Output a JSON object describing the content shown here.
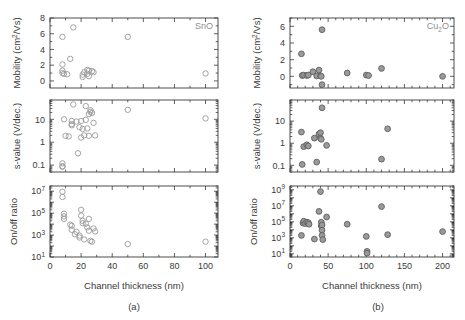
{
  "figure": {
    "title": "",
    "panels": [
      {
        "caption": "(a)",
        "material_label": "SnO",
        "xlabel": "Channel thickness (nm)"
      },
      {
        "caption": "(b)",
        "material_label": "Cu2O",
        "material_label_parts": {
          "pre": "Cu",
          "sub": "2",
          "post": "O"
        },
        "xlabel": "Channel thickness (nm)"
      }
    ]
  },
  "colors": {
    "axis": "#3a3a3a",
    "open_marker_stroke": "#9a9a9a",
    "filled_marker_fill": "#9a9a9a",
    "filled_marker_stroke": "#5f5f5f",
    "label_gray": "#9a9a9a",
    "background": "#ffffff"
  },
  "chart_data": [
    {
      "type": "scatter",
      "panel": "a",
      "subplot": "mobility",
      "title": "SnO",
      "xlabel": "Channel thickness (nm)",
      "ylabel": "Mobility (cm^2/Vs)",
      "ylabel_parts": {
        "pre": "Mobility (cm",
        "sup": "2",
        "post": "/Vs)"
      },
      "xlim": [
        0,
        108
      ],
      "ylim": [
        -0.9,
        8
      ],
      "yticks": [
        0,
        2,
        4,
        6,
        8
      ],
      "xticks": [
        0,
        20,
        40,
        60,
        80,
        100
      ],
      "xminor": 10,
      "marker": "open-circle",
      "grid": false,
      "points": [
        {
          "x": 8,
          "y": 5.6
        },
        {
          "x": 8,
          "y": 2.1
        },
        {
          "x": 8,
          "y": 1.3
        },
        {
          "x": 8,
          "y": 1.0
        },
        {
          "x": 9,
          "y": 0.9
        },
        {
          "x": 11,
          "y": 0.85
        },
        {
          "x": 13,
          "y": 2.8
        },
        {
          "x": 15,
          "y": 6.8
        },
        {
          "x": 21,
          "y": 0.8
        },
        {
          "x": 21,
          "y": 0.5
        },
        {
          "x": 22,
          "y": 1.1
        },
        {
          "x": 24,
          "y": 1.4
        },
        {
          "x": 24,
          "y": 0.9
        },
        {
          "x": 25,
          "y": 1.3
        },
        {
          "x": 25,
          "y": 0.6
        },
        {
          "x": 27,
          "y": 1.25
        },
        {
          "x": 28,
          "y": 1.1
        },
        {
          "x": 50,
          "y": 5.6
        },
        {
          "x": 100,
          "y": 0.95
        }
      ]
    },
    {
      "type": "scatter",
      "panel": "a",
      "subplot": "s-value",
      "xlabel": "Channel thickness (nm)",
      "ylabel": "s-value (V/dec.)",
      "xlim": [
        0,
        108
      ],
      "ylim": [
        0.05,
        70
      ],
      "yscale": "log",
      "yticks": [
        0.1,
        1,
        10
      ],
      "ytick_labels": [
        "0.1",
        "1",
        "10"
      ],
      "xticks": [
        0,
        20,
        40,
        60,
        80,
        100
      ],
      "marker": "open-circle",
      "grid": false,
      "points": [
        {
          "x": 8,
          "y": 0.12
        },
        {
          "x": 8,
          "y": 0.09
        },
        {
          "x": 8,
          "y": 0.085
        },
        {
          "x": 9,
          "y": 10
        },
        {
          "x": 10,
          "y": 1.9
        },
        {
          "x": 12,
          "y": 1.8
        },
        {
          "x": 14,
          "y": 8.5
        },
        {
          "x": 14,
          "y": 6.2
        },
        {
          "x": 14,
          "y": 5.5
        },
        {
          "x": 15,
          "y": 45
        },
        {
          "x": 17,
          "y": 8
        },
        {
          "x": 18,
          "y": 0.33
        },
        {
          "x": 19,
          "y": 4.5
        },
        {
          "x": 20,
          "y": 1.6
        },
        {
          "x": 20,
          "y": 8.5
        },
        {
          "x": 21,
          "y": 3.8
        },
        {
          "x": 22,
          "y": 2.0
        },
        {
          "x": 23,
          "y": 9.5
        },
        {
          "x": 23,
          "y": 38
        },
        {
          "x": 24,
          "y": 4.0
        },
        {
          "x": 25,
          "y": 1.9
        },
        {
          "x": 25,
          "y": 17
        },
        {
          "x": 26,
          "y": 21
        },
        {
          "x": 26,
          "y": 25
        },
        {
          "x": 27,
          "y": 19
        },
        {
          "x": 28,
          "y": 7.0
        },
        {
          "x": 29,
          "y": 2.0
        },
        {
          "x": 50,
          "y": 26
        },
        {
          "x": 100,
          "y": 11
        }
      ]
    },
    {
      "type": "scatter",
      "panel": "a",
      "subplot": "on-off-ratio",
      "xlabel": "Channel thickness (nm)",
      "ylabel": "On/off ratio",
      "xlim": [
        0,
        108
      ],
      "ylim": [
        10,
        30000000
      ],
      "yscale": "log",
      "yticks": [
        10,
        1000,
        100000,
        10000000
      ],
      "ytick_labels": [
        "10^1",
        "10^3",
        "10^5",
        "10^7"
      ],
      "xticks": [
        0,
        20,
        40,
        60,
        80,
        100
      ],
      "marker": "open-circle",
      "grid": false,
      "points": [
        {
          "x": 8,
          "y": 9000000
        },
        {
          "x": 8,
          "y": 3000000
        },
        {
          "x": 9,
          "y": 90000
        },
        {
          "x": 9,
          "y": 50000
        },
        {
          "x": 9,
          "y": 30000
        },
        {
          "x": 13,
          "y": 9000
        },
        {
          "x": 14,
          "y": 7000
        },
        {
          "x": 14,
          "y": 3000
        },
        {
          "x": 16,
          "y": 1200
        },
        {
          "x": 17,
          "y": 2000
        },
        {
          "x": 19,
          "y": 900
        },
        {
          "x": 19,
          "y": 600
        },
        {
          "x": 20,
          "y": 200000
        },
        {
          "x": 20,
          "y": 60000
        },
        {
          "x": 21,
          "y": 20000
        },
        {
          "x": 21,
          "y": 12000
        },
        {
          "x": 22,
          "y": 400
        },
        {
          "x": 23,
          "y": 11000
        },
        {
          "x": 24,
          "y": 5000
        },
        {
          "x": 25,
          "y": 2500
        },
        {
          "x": 25,
          "y": 30000
        },
        {
          "x": 26,
          "y": 300
        },
        {
          "x": 27,
          "y": 250
        },
        {
          "x": 28,
          "y": 4000
        },
        {
          "x": 29,
          "y": 2200
        },
        {
          "x": 50,
          "y": 150
        },
        {
          "x": 100,
          "y": 250
        }
      ]
    },
    {
      "type": "scatter",
      "panel": "b",
      "subplot": "mobility",
      "title": "Cu2O",
      "xlabel": "Channel thickness (nm)",
      "ylabel": "Mobility (cm^2/Vs)",
      "ylabel_parts": {
        "pre": "Mobility (cm",
        "sup": "2",
        "post": "/Vs)"
      },
      "xlim": [
        0,
        215
      ],
      "ylim": [
        -1.4,
        7
      ],
      "yticks": [
        0,
        2,
        4,
        6
      ],
      "xticks": [
        0,
        50,
        100,
        150,
        200
      ],
      "marker": "filled-circle",
      "grid": false,
      "points": [
        {
          "x": 15,
          "y": 2.7
        },
        {
          "x": 16,
          "y": 0.1
        },
        {
          "x": 18,
          "y": 0.15
        },
        {
          "x": 22,
          "y": 0.1
        },
        {
          "x": 24,
          "y": 0.15
        },
        {
          "x": 30,
          "y": 0.55
        },
        {
          "x": 35,
          "y": 0.05
        },
        {
          "x": 38,
          "y": 0.75
        },
        {
          "x": 40,
          "y": 0.05
        },
        {
          "x": 41,
          "y": 0.0
        },
        {
          "x": 42,
          "y": 5.6
        },
        {
          "x": 42,
          "y": -1.0
        },
        {
          "x": 75,
          "y": 0.4
        },
        {
          "x": 100,
          "y": 0.15
        },
        {
          "x": 103,
          "y": 0.1
        },
        {
          "x": 120,
          "y": 0.95
        },
        {
          "x": 200,
          "y": 0.0
        }
      ]
    },
    {
      "type": "scatter",
      "panel": "b",
      "subplot": "s-value",
      "xlabel": "Channel thickness (nm)",
      "ylabel": "s-value (V/dec.)",
      "xlim": [
        0,
        215
      ],
      "ylim": [
        0.05,
        90
      ],
      "yscale": "log",
      "yticks": [
        0.1,
        1,
        10
      ],
      "ytick_labels": [
        "0.1",
        "1",
        "10"
      ],
      "xticks": [
        0,
        50,
        100,
        150,
        200
      ],
      "marker": "filled-circle",
      "grid": false,
      "points": [
        {
          "x": 15,
          "y": 3.2
        },
        {
          "x": 16,
          "y": 0.11
        },
        {
          "x": 18,
          "y": 0.7
        },
        {
          "x": 22,
          "y": 0.85
        },
        {
          "x": 24,
          "y": 0.75
        },
        {
          "x": 32,
          "y": 1.7
        },
        {
          "x": 35,
          "y": 0.14
        },
        {
          "x": 38,
          "y": 2.6
        },
        {
          "x": 40,
          "y": 3.0
        },
        {
          "x": 40,
          "y": 1.7
        },
        {
          "x": 41,
          "y": 1.5
        },
        {
          "x": 42,
          "y": 40
        },
        {
          "x": 48,
          "y": 0.8
        },
        {
          "x": 120,
          "y": 0.19
        },
        {
          "x": 128,
          "y": 4.5
        }
      ]
    },
    {
      "type": "scatter",
      "panel": "b",
      "subplot": "on-off-ratio",
      "xlabel": "Channel thickness (nm)",
      "ylabel": "On/off ratio",
      "xlim": [
        0,
        215
      ],
      "ylim": [
        4,
        3000000000
      ],
      "yscale": "log",
      "yticks": [
        10,
        1000,
        100000,
        10000000,
        1000000000
      ],
      "ytick_labels": [
        "10^1",
        "10^3",
        "10^5",
        "10^7",
        "10^9"
      ],
      "xticks": [
        0,
        50,
        100,
        150,
        200
      ],
      "marker": "filled-circle",
      "grid": false,
      "points": [
        {
          "x": 15,
          "y": 2000
        },
        {
          "x": 17,
          "y": 70000
        },
        {
          "x": 18,
          "y": 120000
        },
        {
          "x": 20,
          "y": 60000
        },
        {
          "x": 22,
          "y": 90000
        },
        {
          "x": 24,
          "y": 80000
        },
        {
          "x": 25,
          "y": 50000
        },
        {
          "x": 32,
          "y": 700
        },
        {
          "x": 38,
          "y": 2000000
        },
        {
          "x": 40,
          "y": 600000000
        },
        {
          "x": 41,
          "y": 90000
        },
        {
          "x": 41,
          "y": 30000
        },
        {
          "x": 42,
          "y": 40000
        },
        {
          "x": 42,
          "y": 9000
        },
        {
          "x": 42,
          "y": 2000
        },
        {
          "x": 43,
          "y": 600
        },
        {
          "x": 48,
          "y": 400000
        },
        {
          "x": 75,
          "y": 50000
        },
        {
          "x": 100,
          "y": 1500
        },
        {
          "x": 101,
          "y": 20
        },
        {
          "x": 101,
          "y": 12
        },
        {
          "x": 120,
          "y": 8000000
        },
        {
          "x": 128,
          "y": 2500
        },
        {
          "x": 200,
          "y": 6000
        }
      ]
    }
  ]
}
